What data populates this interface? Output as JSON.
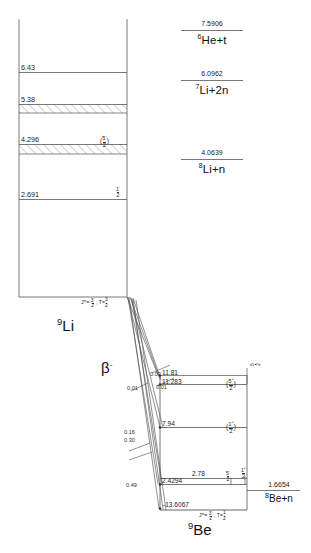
{
  "diagram": {
    "title_left": "9Li",
    "title_left_mass": "9",
    "title_left_sym": "Li",
    "title_right_mass": "9",
    "title_right_sym": "Be",
    "decay_label": "β",
    "decay_sup": "-"
  },
  "li9": {
    "jpi_ground": "Jπ = 3/2− ; T = 3/2",
    "levels": [
      {
        "energy": "6.43",
        "spin": "",
        "hatched": false
      },
      {
        "energy": "5.38",
        "spin": "",
        "hatched": true
      },
      {
        "energy": "4.296",
        "spin": "(5/2−)",
        "hatched": true
      },
      {
        "energy": "2.691",
        "spin": "1/2−",
        "hatched": false
      }
    ]
  },
  "thresholds": [
    {
      "energy": "7.5906",
      "channel_mass": "6",
      "channel": "He+t"
    },
    {
      "energy": "6.0962",
      "channel_mass": "7",
      "channel": "Li+2n"
    },
    {
      "energy": "4.0639",
      "channel_mass": "8",
      "channel": "Li+n"
    }
  ],
  "be9": {
    "jpi_ground": "Jπ = 3/2− ; T = 1/2",
    "levels": [
      {
        "energy": "11.81",
        "spin": ""
      },
      {
        "energy": "11.283",
        "spin": "(5/2+)"
      },
      {
        "energy": "7.94",
        "spin": "(1/2+)"
      },
      {
        "energy": "2.78",
        "spin": "1/2+"
      },
      {
        "energy": "2.4294",
        "spin": "5/2−"
      },
      {
        "energy": "-13.6067",
        "spin": ""
      }
    ],
    "threshold": {
      "energy": "1.6654",
      "channel_mass": "8",
      "channel": "Be+n"
    }
  },
  "branches": [
    {
      "value": "0.03"
    },
    {
      "value": "0.01"
    },
    {
      "value": "0.01"
    },
    {
      "value": "0.16"
    },
    {
      "value": "0.30"
    },
    {
      "value": "0.49"
    }
  ],
  "colors": {
    "line": "#555555",
    "text": "#1a1a1a",
    "hatch": "#777777"
  }
}
